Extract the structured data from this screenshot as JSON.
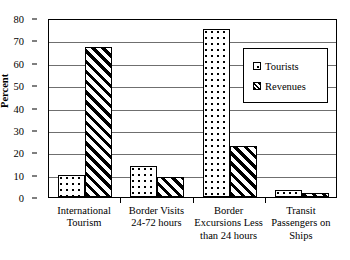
{
  "chart_data": {
    "type": "bar",
    "title": "",
    "xlabel": "",
    "ylabel": "Percent",
    "ylim": [
      0,
      80
    ],
    "yticks": [
      0,
      10,
      20,
      30,
      40,
      50,
      60,
      70,
      80
    ],
    "ytick_labels": [
      "0",
      "10",
      "20",
      "30",
      "40",
      "50",
      "60",
      "70",
      "80"
    ],
    "grid": true,
    "legend_position": "upper-right",
    "categories": [
      "International Tourism",
      "Border Visits 24-72 hours",
      "Border Excursions Less than 24 hours",
      "Transit Passengers on Ships"
    ],
    "category_lines": [
      [
        "International",
        "Tourism"
      ],
      [
        "Border Visits",
        "24-72 hours"
      ],
      [
        "Border",
        "Excursions Less",
        "than 24 hours"
      ],
      [
        "Transit",
        "Passengers on",
        "Ships"
      ]
    ],
    "series": [
      {
        "name": "Tourists",
        "pattern": "dots",
        "values": [
          10,
          14,
          75,
          3
        ]
      },
      {
        "name": "Revenues",
        "pattern": "hatch",
        "values": [
          67,
          9,
          23,
          2
        ]
      }
    ]
  },
  "colors": {
    "ink": "#000000",
    "gridline": "#6f6f6f",
    "background": "#ffffff"
  }
}
